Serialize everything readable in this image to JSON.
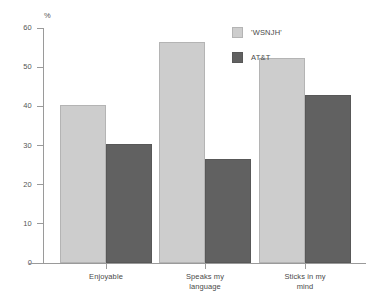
{
  "chart_data": {
    "type": "bar",
    "title": "",
    "xlabel": "",
    "ylabel": "%",
    "ylim": [
      0,
      60
    ],
    "ytick_step": 10,
    "yticks": [
      0,
      10,
      20,
      30,
      40,
      50,
      60
    ],
    "ytick_labels": [
      "0",
      "10",
      "20",
      "30",
      "40",
      "50",
      "60"
    ],
    "grid": false,
    "legend_position": "top-right",
    "categories": [
      "Enjoyable",
      "Speaks my language",
      "Sticks in my mind"
    ],
    "category_lines": [
      [
        "Enjoyable"
      ],
      [
        "Speaks my",
        "language"
      ],
      [
        "Sticks in my",
        "mind"
      ]
    ],
    "series": [
      {
        "name": "'WSNJH'",
        "color": "#cdcdcd",
        "values": [
          40.3,
          56.4,
          52.4
        ]
      },
      {
        "name": "AT&T",
        "color": "#616161",
        "values": [
          30.4,
          26.6,
          43.0
        ]
      }
    ]
  },
  "legend": {
    "items": [
      {
        "label": "'WSNJH'"
      },
      {
        "label": "AT&T"
      }
    ]
  },
  "axis": {
    "unit_label": "%"
  }
}
